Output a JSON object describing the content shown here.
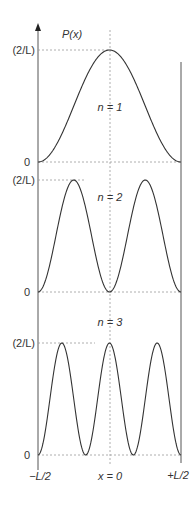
{
  "figure": {
    "y_axis_label": "P(x)",
    "y_max_label": "(2/L)",
    "y_zero_label": "0",
    "x_labels": {
      "left": "−L/2",
      "center": "x = 0",
      "right": "+L/2"
    },
    "colors": {
      "curve": "#333333",
      "axis": "#555555",
      "guide": "#999999"
    }
  },
  "chart_data": {
    "type": "line",
    "xlabel": "x",
    "ylabel": "P(x)",
    "x_ticks": [
      "-L/2",
      "x = 0",
      "+L/2"
    ],
    "y_ticks": [
      "0",
      "(2/L)"
    ],
    "xlim": [
      -0.5,
      0.5
    ],
    "ylim": [
      0,
      2
    ],
    "series": [
      {
        "name": "n = 1",
        "label": "n = 1",
        "function": "(2/L) cos^2(pi x / L)",
        "x": [
          -0.5,
          -0.25,
          0,
          0.25,
          0.5
        ],
        "values": [
          0,
          1,
          2,
          1,
          0
        ]
      },
      {
        "name": "n = 2",
        "label": "n = 2",
        "function": "(2/L) sin^2(2 pi x / L)",
        "x": [
          -0.5,
          -0.25,
          0,
          0.25,
          0.5
        ],
        "values": [
          0,
          2,
          0,
          2,
          0
        ]
      },
      {
        "name": "n = 3",
        "label": "n = 3",
        "function": "(2/L) cos^2(3 pi x / L)",
        "x": [
          -0.5,
          -0.333,
          -0.1667,
          0,
          0.1667,
          0.333,
          0.5
        ],
        "values": [
          0,
          2,
          0,
          2,
          0,
          2,
          0
        ]
      }
    ],
    "grid": false
  }
}
